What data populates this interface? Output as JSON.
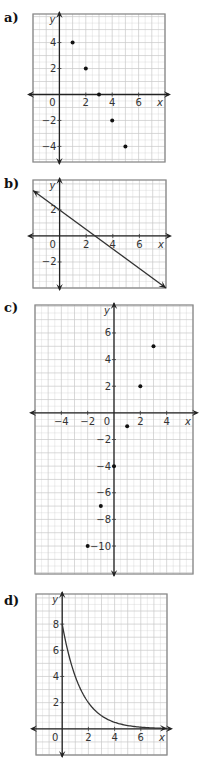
{
  "chart_data": [
    {
      "panel_label": "a)",
      "type": "scatter",
      "title": "",
      "xlabel": "x",
      "ylabel": "y",
      "xlim": [
        -2,
        8
      ],
      "ylim": [
        -5.2,
        6.2
      ],
      "grid": true,
      "x_ticks": [
        {
          "value": 0,
          "label": "0"
        },
        {
          "value": 2,
          "label": "2"
        },
        {
          "value": 4,
          "label": "4"
        },
        {
          "value": 6,
          "label": "6"
        }
      ],
      "y_ticks": [
        {
          "value": 4,
          "label": "4"
        },
        {
          "value": 2,
          "label": "2"
        },
        {
          "value": -2,
          "label": "−2"
        },
        {
          "value": -4,
          "label": "−4"
        }
      ],
      "points": [
        {
          "x": 1,
          "y": 4
        },
        {
          "x": 2,
          "y": 2
        },
        {
          "x": 3,
          "y": 0
        },
        {
          "x": 4,
          "y": -2
        },
        {
          "x": 5,
          "y": -4
        }
      ]
    },
    {
      "panel_label": "b)",
      "type": "line",
      "title": "",
      "xlabel": "x",
      "ylabel": "y",
      "xlim": [
        -2,
        8
      ],
      "ylim": [
        -4,
        4.3
      ],
      "grid": true,
      "x_ticks": [
        {
          "value": 0,
          "label": "0"
        },
        {
          "value": 2,
          "label": "2"
        },
        {
          "value": 4,
          "label": "4"
        },
        {
          "value": 6,
          "label": "6"
        }
      ],
      "y_ticks": [
        {
          "value": 2,
          "label": "2"
        },
        {
          "value": -2,
          "label": "−2"
        }
      ],
      "line": {
        "slope": -0.75,
        "intercept": 2,
        "x_from": -2,
        "x_to": 8,
        "arrows": "both"
      }
    },
    {
      "panel_label": "c)",
      "type": "scatter",
      "title": "",
      "xlabel": "x",
      "ylabel": "y",
      "xlim": [
        -6,
        6
      ],
      "ylim": [
        -12.1,
        8.1
      ],
      "grid": true,
      "x_ticks": [
        {
          "value": -4,
          "label": "−4"
        },
        {
          "value": -2,
          "label": "−2"
        },
        {
          "value": 0,
          "label": "0"
        },
        {
          "value": 2,
          "label": "2"
        },
        {
          "value": 4,
          "label": "4"
        }
      ],
      "y_ticks": [
        {
          "value": 6,
          "label": "6"
        },
        {
          "value": 4,
          "label": "4"
        },
        {
          "value": 2,
          "label": "2"
        },
        {
          "value": -2,
          "label": "−2"
        },
        {
          "value": -4,
          "label": "−4"
        },
        {
          "value": -6,
          "label": "−6"
        },
        {
          "value": -8,
          "label": "−8"
        },
        {
          "value": -10,
          "label": "−10"
        }
      ],
      "points": [
        {
          "x": -2,
          "y": -10
        },
        {
          "x": -1,
          "y": -7
        },
        {
          "x": 0,
          "y": -4
        },
        {
          "x": 1,
          "y": -1
        },
        {
          "x": 2,
          "y": 2
        },
        {
          "x": 3,
          "y": 5
        }
      ]
    },
    {
      "panel_label": "d)",
      "type": "line",
      "title": "",
      "xlabel": "x",
      "ylabel": "y",
      "xlim": [
        -2,
        8
      ],
      "ylim": [
        -2,
        10.3
      ],
      "grid": true,
      "x_ticks": [
        {
          "value": 0,
          "label": "0"
        },
        {
          "value": 2,
          "label": "2"
        },
        {
          "value": 4,
          "label": "4"
        },
        {
          "value": 6,
          "label": "6"
        }
      ],
      "y_ticks": [
        {
          "value": 8,
          "label": "8"
        },
        {
          "value": 6,
          "label": "6"
        },
        {
          "value": 4,
          "label": "4"
        },
        {
          "value": 2,
          "label": "2"
        }
      ],
      "curve": {
        "function": "8*(0.5)^x",
        "a": 8,
        "b": 0.5,
        "x_from": 0,
        "x_to": 8,
        "arrows": "end"
      }
    }
  ]
}
